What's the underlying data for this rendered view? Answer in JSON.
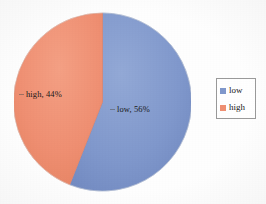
{
  "chart_data": {
    "type": "pie",
    "title": "",
    "categories": [
      "low",
      "high"
    ],
    "values": [
      56,
      44
    ],
    "value_unit": "%",
    "labels": [
      {
        "key": "low",
        "text": "low, 56%",
        "value": 56,
        "color": "#8098cc"
      },
      {
        "key": "high",
        "text": "high, 44%",
        "value": 44,
        "color": "#ef8f72"
      }
    ],
    "legend": {
      "position": "right",
      "entries": [
        {
          "label": "low",
          "color": "#8098cc"
        },
        {
          "label": "high",
          "color": "#ef8f72"
        }
      ]
    },
    "grid": false,
    "xlabel": "",
    "ylabel": ""
  },
  "colors": {
    "low": "#8098cc",
    "high": "#ef8f72",
    "low_edge": "#6f8cc4",
    "high_edge": "#e4805f",
    "background": "#ffffff",
    "legend_border": "#9a9a9a",
    "text": "#1a1a1a"
  },
  "pie": {
    "low_label": "low, 56%",
    "high_label": "high, 44%"
  },
  "legend": {
    "items": [
      {
        "label": "low"
      },
      {
        "label": "high"
      }
    ]
  }
}
